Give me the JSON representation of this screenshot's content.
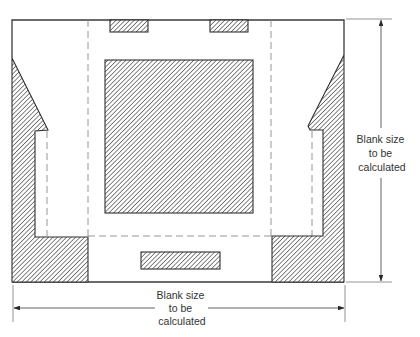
{
  "diagram": {
    "type": "sheet-metal blank layout",
    "dimension_vertical": {
      "lines": [
        "Blank size",
        "to be",
        "calculated"
      ]
    },
    "dimension_horizontal": {
      "lines": [
        "Blank size",
        "to be",
        "calculated"
      ]
    },
    "colors": {
      "line": "#3a3a3a",
      "hatch": "#444444",
      "dashed": "#8a8a8a",
      "background": "#ffffff"
    }
  }
}
